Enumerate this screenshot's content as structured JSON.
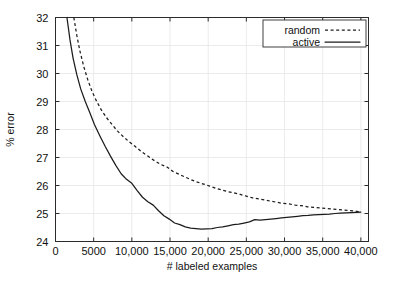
{
  "chart_data": {
    "type": "line",
    "title": "",
    "xlabel": "# labeled examples",
    "ylabel": "% error",
    "xlim": [
      0,
      41000
    ],
    "ylim": [
      24,
      32
    ],
    "grid": true,
    "legend_position": "top-right",
    "xticks": [
      0,
      5000,
      10000,
      15000,
      20000,
      25000,
      30000,
      35000,
      40000
    ],
    "xtick_labels": [
      "0",
      "5000",
      "10,000",
      "15,000",
      "20,000",
      "25,000",
      "30,000",
      "35,000",
      "40,000"
    ],
    "yticks": [
      24,
      25,
      26,
      27,
      28,
      29,
      30,
      31,
      32
    ],
    "ytick_labels": [
      "24",
      "25",
      "26",
      "27",
      "28",
      "29",
      "30",
      "31",
      "32"
    ],
    "series": [
      {
        "name": "random",
        "style": "dashed",
        "color": "#1c1c1c",
        "x": [
          2400,
          2800,
          3200,
          3700,
          4200,
          4800,
          5400,
          6000,
          6700,
          7400,
          8100,
          8900,
          9700,
          10500,
          11300,
          12100,
          13000,
          13800,
          14600,
          15400,
          16200,
          17000,
          17800,
          18600,
          19400,
          20200,
          21000,
          21800,
          22600,
          23400,
          24200,
          25000,
          25800,
          26600,
          27400,
          28200,
          29000,
          29800,
          30600,
          31400,
          32200,
          33000,
          33800,
          34600,
          35400,
          36200,
          37000,
          37800,
          38600,
          39400,
          40000
        ],
        "y": [
          32.0,
          31.35,
          30.8,
          30.25,
          29.8,
          29.35,
          29.0,
          28.7,
          28.42,
          28.18,
          27.95,
          27.74,
          27.55,
          27.38,
          27.2,
          27.05,
          26.88,
          26.75,
          26.66,
          26.5,
          26.4,
          26.3,
          26.2,
          26.12,
          26.05,
          25.98,
          25.9,
          25.84,
          25.78,
          25.74,
          25.68,
          25.62,
          25.56,
          25.52,
          25.48,
          25.44,
          25.4,
          25.36,
          25.34,
          25.3,
          25.28,
          25.24,
          25.22,
          25.2,
          25.18,
          25.16,
          25.14,
          25.12,
          25.1,
          25.08,
          25.06
        ]
      },
      {
        "name": "active",
        "style": "solid",
        "color": "#1c1c1c",
        "x": [
          1500,
          1900,
          2300,
          2800,
          3300,
          3900,
          4500,
          5100,
          5800,
          6500,
          7200,
          7900,
          8600,
          9300,
          10000,
          10700,
          11400,
          12100,
          12800,
          13500,
          14200,
          14900,
          15600,
          16300,
          17000,
          17700,
          18400,
          19100,
          19800,
          20500,
          21200,
          21900,
          22600,
          23300,
          24000,
          24700,
          25400,
          26100,
          26800,
          27500,
          28200,
          28900,
          29600,
          30300,
          31000,
          31700,
          32400,
          33100,
          33800,
          34500,
          35200,
          35900,
          36600,
          37300,
          38000,
          38700,
          39400,
          40000
        ],
        "y": [
          32.0,
          31.2,
          30.55,
          29.95,
          29.45,
          29.0,
          28.6,
          28.18,
          27.78,
          27.4,
          27.05,
          26.72,
          26.42,
          26.22,
          26.08,
          25.82,
          25.58,
          25.42,
          25.3,
          25.1,
          24.92,
          24.8,
          24.66,
          24.6,
          24.52,
          24.48,
          24.46,
          24.44,
          24.45,
          24.46,
          24.5,
          24.52,
          24.56,
          24.6,
          24.62,
          24.66,
          24.7,
          24.78,
          24.76,
          24.78,
          24.8,
          24.82,
          24.84,
          24.86,
          24.88,
          24.9,
          24.92,
          24.93,
          24.95,
          24.96,
          24.97,
          24.98,
          25.0,
          25.01,
          25.02,
          25.03,
          25.04,
          25.05
        ]
      }
    ]
  }
}
